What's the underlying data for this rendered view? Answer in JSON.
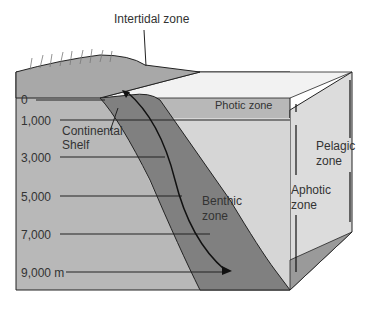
{
  "labels": {
    "intertidal": "Intertidal zone",
    "photic": "Photic zone",
    "continental_shelf_1": "Continental",
    "continental_shelf_2": "Shelf",
    "pelagic_1": "Pelagic",
    "pelagic_2": "zone",
    "aphotic_1": "Aphotic",
    "aphotic_2": "zone",
    "benthic_1": "Benthic",
    "benthic_2": "zone"
  },
  "depths": [
    "0",
    "1,000",
    "3,000",
    "5,000",
    "7,000",
    "9,000 m"
  ],
  "colors": {
    "block_front": "#b5b5b5",
    "water": "#d8d8d8",
    "land": "#a9a9a9",
    "slope": "#7e7e7e",
    "line": "#222222"
  }
}
